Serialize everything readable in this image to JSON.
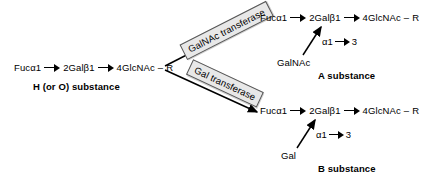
{
  "diagram": {
    "precursor": {
      "name": "H (or O) substance",
      "chain": {
        "residue1": "Fucα1",
        "residue2": "2Galβ1",
        "residue3": "4GlcNAc",
        "dash": "–",
        "terminus": "R"
      },
      "label": "H (or O) substance"
    },
    "branches": [
      {
        "id": "a-branch",
        "enzyme": "GalNAc transferase",
        "product_label": "A substance",
        "donor": "GalNAc",
        "linkage_alpha": "α1",
        "linkage_position": "3",
        "chain": {
          "residue1": "Fucα1",
          "residue2": "2Galβ1",
          "residue3": "4GlcNAc",
          "dash": "–",
          "terminus": "R"
        }
      },
      {
        "id": "b-branch",
        "enzyme": "Gal transferase",
        "product_label": "B substance",
        "donor": "Gal",
        "linkage_alpha": "α1",
        "linkage_position": "3",
        "chain": {
          "residue1": "Fucα1",
          "residue2": "2Galβ1",
          "residue3": "4GlcNAc",
          "dash": "–",
          "terminus": "R"
        }
      }
    ],
    "colors": {
      "stroke": "#000000",
      "enzyme_box_fill": "#e8e8e8",
      "enzyme_box_border": "#555555",
      "background": "#ffffff"
    }
  }
}
